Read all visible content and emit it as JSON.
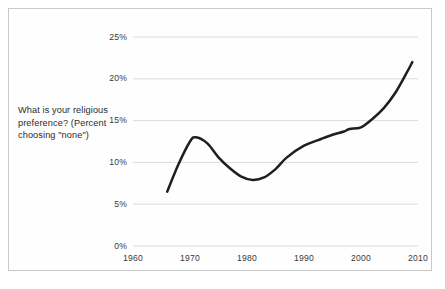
{
  "figure": {
    "caption": "What is your religious preference? (Percent choosing \"none\")",
    "frame_color": "#c9c9c9",
    "background": "#ffffff"
  },
  "chart_data": {
    "type": "line",
    "title": "",
    "subtitle": "",
    "annotation": "What is your religious preference? (Percent choosing \"none\")",
    "xlabel": "",
    "ylabel": "",
    "xlim": [
      1960,
      2010
    ],
    "ylim": [
      0,
      25
    ],
    "xticks": [
      1960,
      1970,
      1980,
      1990,
      2000,
      2010
    ],
    "xtick_labels": [
      "1960",
      "1970",
      "1980",
      "1990",
      "2000",
      "2010"
    ],
    "yticks": [
      0,
      5,
      10,
      15,
      20,
      25
    ],
    "ytick_labels": [
      "0%",
      "5%",
      "10%",
      "15%",
      "20%",
      "25%"
    ],
    "grid": "horizontal",
    "legend": "none",
    "series": [
      {
        "name": "Percent choosing \"none\"",
        "color": "#1f1f1f",
        "line_width": 2.5,
        "x": [
          1966,
          1968,
          1970,
          1971,
          1973,
          1975,
          1977,
          1979,
          1981,
          1983,
          1985,
          1987,
          1990,
          1993,
          1995,
          1997,
          1998,
          2000,
          2002,
          2004,
          2006,
          2008,
          2009
        ],
        "values": [
          6.5,
          9.8,
          12.5,
          13.0,
          12.3,
          10.6,
          9.3,
          8.3,
          7.9,
          8.2,
          9.2,
          10.6,
          12.0,
          12.8,
          13.3,
          13.7,
          14.0,
          14.2,
          15.2,
          16.5,
          18.3,
          20.7,
          22.0
        ]
      }
    ]
  },
  "axes": {
    "plot_left_px": 133,
    "plot_right_px": 418,
    "plot_top_px": 37,
    "plot_bottom_px": 246,
    "gridline_color": "#dcdcdc"
  }
}
